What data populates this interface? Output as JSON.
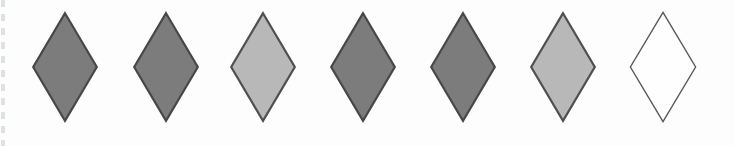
{
  "figure": {
    "background_color": "#fdfdfd",
    "diamond_count": 7,
    "shade_pattern": [
      "dark-gray",
      "dark-gray",
      "light-gray",
      "dark-gray",
      "dark-gray",
      "light-gray",
      "white-outline"
    ],
    "colors": {
      "dark_gray_fill": "#7c7c7c",
      "light_gray_fill": "#b8b8b8",
      "white_fill": "#fefefe",
      "outline_dark": "#474747",
      "outline_light_diamond": "#4f4f4f",
      "outline_white_diamond": "#5a5a5a"
    },
    "diamonds": [
      {
        "name": "diamond-1",
        "shade": "dark-gray",
        "fill": "#7c7c7c",
        "stroke": "#474747",
        "stroke_width": 2.2
      },
      {
        "name": "diamond-2",
        "shade": "dark-gray",
        "fill": "#7c7c7c",
        "stroke": "#474747",
        "stroke_width": 2.2
      },
      {
        "name": "diamond-3",
        "shade": "light-gray",
        "fill": "#b8b8b8",
        "stroke": "#4f4f4f",
        "stroke_width": 2.2
      },
      {
        "name": "diamond-4",
        "shade": "dark-gray",
        "fill": "#7c7c7c",
        "stroke": "#474747",
        "stroke_width": 2.2
      },
      {
        "name": "diamond-5",
        "shade": "dark-gray",
        "fill": "#7c7c7c",
        "stroke": "#474747",
        "stroke_width": 2.2
      },
      {
        "name": "diamond-6",
        "shade": "light-gray",
        "fill": "#b8b8b8",
        "stroke": "#4f4f4f",
        "stroke_width": 2.2
      },
      {
        "name": "diamond-7",
        "shade": "white-outline",
        "fill": "#fefefe",
        "stroke": "#5a5a5a",
        "stroke_width": 1.4
      }
    ],
    "geometry": {
      "centers_x": [
        65,
        166,
        263,
        363,
        463,
        563,
        663
      ],
      "center_y": 67,
      "diamond_width": 68,
      "diamond_height": 112
    }
  }
}
